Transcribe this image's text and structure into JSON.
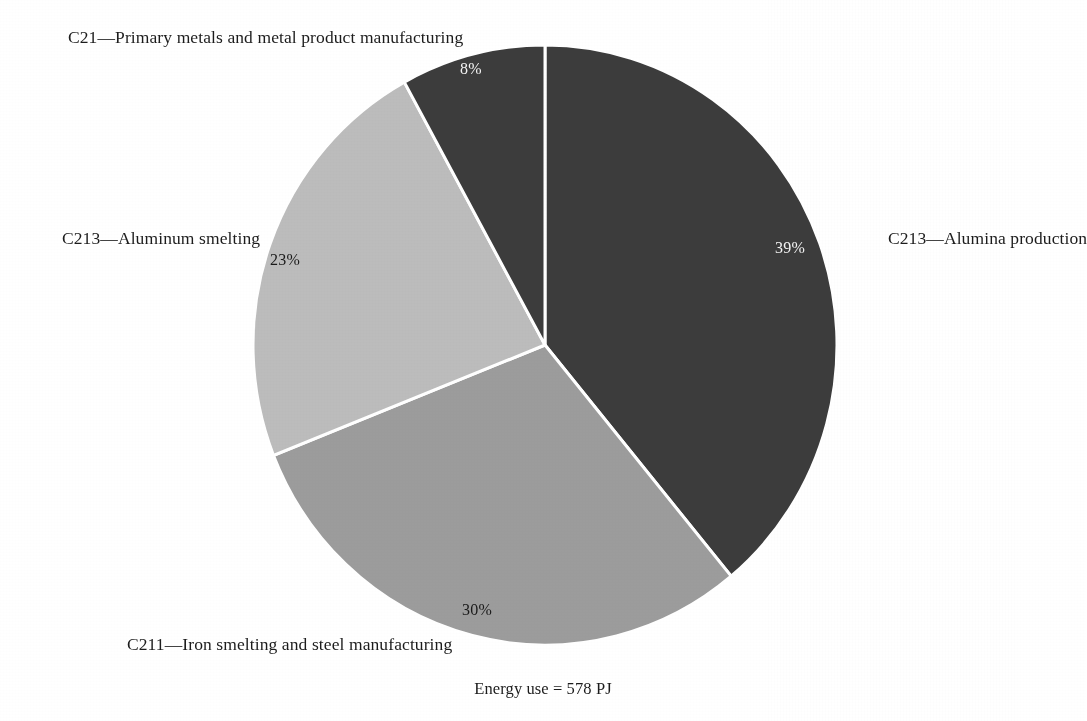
{
  "figure": {
    "footnote": "Energy use = 578 PJ"
  },
  "chart_data": {
    "type": "pie",
    "title": "",
    "subtitle": "",
    "xlabel": "",
    "ylabel": "",
    "legend_position": "outside-labels",
    "grid": false,
    "units": "percent of energy use",
    "total_label": "Energy use = 578 PJ",
    "total_value": 578,
    "total_units": "PJ",
    "start_angle_deg": 0,
    "direction": "clockwise",
    "categories": [
      "C213—Alumina production",
      "C211—Iron smelting and steel manufacturing",
      "C213—Aluminum smelting",
      "C21—Primary metals and metal product manufacturing"
    ],
    "values": [
      39,
      30,
      23,
      8
    ],
    "value_labels": [
      "39%",
      "30%",
      "23%",
      "8%"
    ],
    "slices": [
      {
        "label": "C213—Alumina production",
        "value": 39,
        "value_label": "39%",
        "color": "#3c3c3c",
        "label_color": "#f2f2f2"
      },
      {
        "label": "C211—Iron smelting and steel manufacturing",
        "value": 30,
        "value_label": "30%",
        "color": "#9c9c9c",
        "label_color": "#1a1a1a"
      },
      {
        "label": "C213—Aluminum smelting",
        "value": 23,
        "value_label": "23%",
        "color": "#bcbcbc",
        "label_color": "#1a1a1a"
      },
      {
        "label": "C21—Primary metals and metal product manufacturing",
        "value": 8,
        "value_label": "8%",
        "color": "#3c3c3c",
        "label_color": "#f2f2f2"
      }
    ],
    "colors": [
      "#3c3c3c",
      "#9c9c9c",
      "#bcbcbc",
      "#3c3c3c"
    ],
    "separator_color": "#ffffff"
  },
  "labels": {
    "c21": "C21—Primary metals and metal product manufacturing",
    "alumina": "C213—Alumina production",
    "aluminum_smelting": "C213—Aluminum smelting",
    "iron_steel": "C211—Iron smelting and steel manufacturing"
  },
  "percent_labels": {
    "top": "8%",
    "right": "39%",
    "left": "23%",
    "bottom": "30%"
  }
}
